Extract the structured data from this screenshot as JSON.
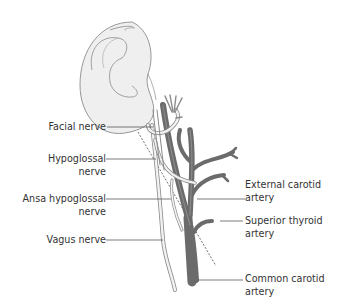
{
  "diagram": {
    "colors": {
      "artery": "#6b6b6b",
      "artery_highlight": "#8a8a8a",
      "nerve_fill": "#f2f2f2",
      "nerve_outline": "#8a8a8a",
      "ear_fill": "#efefef",
      "ear_outline": "#8c8c8c",
      "leader_line": "#444444",
      "text": "#333333"
    },
    "labels_left": [
      {
        "id": "facial-nerve",
        "line1": "Facial nerve",
        "line2": ""
      },
      {
        "id": "hypoglossal-nerve",
        "line1": "Hypoglossal",
        "line2": "nerve"
      },
      {
        "id": "ansa-hypoglossal-nerve",
        "line1": "Ansa hypoglossal",
        "line2": "nerve"
      },
      {
        "id": "vagus-nerve",
        "line1": "Vagus nerve",
        "line2": ""
      }
    ],
    "labels_right": [
      {
        "id": "external-carotid-artery",
        "line1": "External carotid",
        "line2": "artery"
      },
      {
        "id": "superior-thyroid-artery",
        "line1": "Superior thyroid",
        "line2": "artery"
      },
      {
        "id": "common-carotid-artery",
        "line1": "Common carotid",
        "line2": "artery"
      }
    ]
  }
}
